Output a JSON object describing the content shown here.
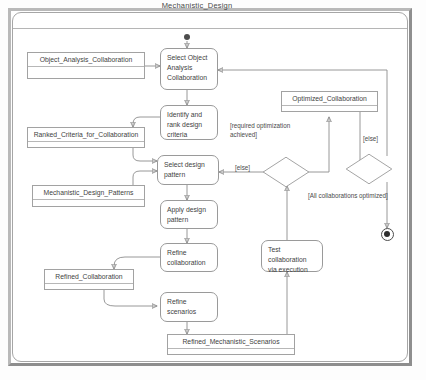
{
  "diagram": {
    "title": "Mechanistic_Design",
    "type": "uml-activity-diagram"
  },
  "nodes": {
    "start": {
      "name": "initial-node",
      "label": ""
    },
    "end": {
      "name": "final-node",
      "label": ""
    },
    "actions": [
      {
        "id": "select-object-analysis-collaboration",
        "label": "Select Object Analysis Collaboration"
      },
      {
        "id": "identify-and-rank-design-criteria",
        "label": "Identify and rank design criteria"
      },
      {
        "id": "select-design-pattern",
        "label": "Select design pattern"
      },
      {
        "id": "apply-design-pattern",
        "label": "Apply design pattern"
      },
      {
        "id": "refine-collaboration",
        "label": "Refine collaboration"
      },
      {
        "id": "refine-scenarios",
        "label": "Refine scenarios"
      },
      {
        "id": "test-collaboration-via-execution",
        "label": "Test collaboration via execution"
      }
    ],
    "objects": [
      {
        "id": "object-analysis-collaboration",
        "label": "Object_Analysis_Collaboration"
      },
      {
        "id": "ranked-criteria-for-collaboration",
        "label": "Ranked_Criteria_for_Collaboration"
      },
      {
        "id": "mechanistic-design-patterns",
        "label": "Mechanistic_Design_Patterns"
      },
      {
        "id": "refined-collaboration",
        "label": "Refined_Collaboration"
      },
      {
        "id": "refined-mechanistic-scenarios",
        "label": "Refined_Mechanistic_Scenarios"
      },
      {
        "id": "optimized-collaboration",
        "label": "Optimized_Collaboration"
      }
    ],
    "decisions": [
      {
        "id": "optimization-decision",
        "label": ""
      },
      {
        "id": "all-collaborations-decision",
        "label": ""
      }
    ]
  },
  "guards": {
    "else_left": "[else]",
    "else_right": "[else]",
    "required_optimization": "[required optimization achieved]",
    "all_collaborations_optimized": "[All collaborations optimized]"
  },
  "colors": {
    "line": "#8d8d8d",
    "node_border": "#9a9a9a",
    "text": "#3f3f3f",
    "frame": "#a6a6a6",
    "chrome": "#b9b9b9"
  }
}
